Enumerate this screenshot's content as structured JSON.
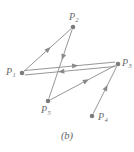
{
  "figure": {
    "caption": "(b)",
    "stroke_color": "#8a8a8a",
    "node_color": "#7d7d7d",
    "label_color": "#6b6b6b",
    "background": "#ffffff"
  },
  "chart_data": {
    "type": "diagram",
    "title": "(b)",
    "subtype": "directed-graph",
    "nodes": [
      {
        "id": "P1",
        "label": "P",
        "subscript": "1",
        "x": 22,
        "y": 73,
        "label_x": 6,
        "label_y": 67
      },
      {
        "id": "P2",
        "label": "P",
        "subscript": "2",
        "x": 73,
        "y": 27,
        "label_x": 69,
        "label_y": 12
      },
      {
        "id": "P3",
        "label": "P",
        "subscript": "3",
        "x": 118,
        "y": 64,
        "label_x": 122,
        "label_y": 58
      },
      {
        "id": "P4",
        "label": "P",
        "subscript": "4",
        "x": 92,
        "y": 116,
        "label_x": 98,
        "label_y": 112
      },
      {
        "id": "P5",
        "label": "P",
        "subscript": "5",
        "x": 48,
        "y": 101,
        "label_x": 41,
        "label_y": 105
      }
    ],
    "edges": [
      {
        "id": "e1",
        "from": "P1",
        "to": "P2",
        "arrow_t": 0.52
      },
      {
        "id": "e2",
        "from": "P2",
        "to": "P5",
        "arrow_t": 0.4
      },
      {
        "id": "e3",
        "from": "P1",
        "to": "P3",
        "arrow_t": 0.56,
        "offset": -2.2
      },
      {
        "id": "e4",
        "from": "P3",
        "to": "P1",
        "arrow_t": 0.6,
        "offset": -2.2
      },
      {
        "id": "e5",
        "from": "P5",
        "to": "P3",
        "arrow_t": 0.55
      },
      {
        "id": "e6",
        "from": "P4",
        "to": "P3",
        "arrow_t": 0.55
      }
    ],
    "node_radius": 2.3,
    "xlim": [
      0,
      134
    ],
    "ylim": [
      0,
      152
    ]
  }
}
